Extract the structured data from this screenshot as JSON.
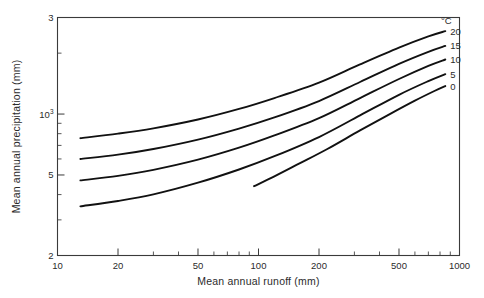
{
  "chart_data": {
    "type": "line",
    "title": "",
    "xlabel": "Mean annual runoff (mm)",
    "ylabel": "Mean annual precipitation (mm)",
    "xscale": "log",
    "yscale": "log",
    "xlim": [
      10,
      1000
    ],
    "ylim": [
      200,
      3000
    ],
    "grid": false,
    "legend_position": "inside-right",
    "legend_title": "°C",
    "xticks": [
      {
        "value": 10,
        "label": "10"
      },
      {
        "value": 20,
        "label": "20"
      },
      {
        "value": 50,
        "label": "50"
      },
      {
        "value": 100,
        "label": "100"
      },
      {
        "value": 200,
        "label": "200"
      },
      {
        "value": 500,
        "label": "500"
      },
      {
        "value": 1000,
        "label": "1000"
      }
    ],
    "xticks_minor": [
      30,
      40,
      60,
      70,
      80,
      90,
      300,
      400,
      600,
      700,
      800,
      900
    ],
    "yticks": [
      {
        "value": 200,
        "label": "2",
        "sup": ""
      },
      {
        "value": 500,
        "label": "5",
        "sup": ""
      },
      {
        "value": 1000,
        "label": "10",
        "sup": "3"
      },
      {
        "value": 3000,
        "label": "3",
        "sup": ""
      }
    ],
    "yticks_minor": [
      300,
      400,
      600,
      700,
      800,
      900,
      2000
    ],
    "series": [
      {
        "name": "20",
        "label": "20",
        "color": "#111111",
        "x": [
          13,
          20,
          30,
          50,
          80,
          120,
          200,
          320,
          500,
          700,
          850
        ],
        "y": [
          760,
          800,
          850,
          940,
          1060,
          1200,
          1430,
          1760,
          2130,
          2420,
          2570
        ]
      },
      {
        "name": "15",
        "label": "15",
        "color": "#111111",
        "x": [
          13,
          20,
          30,
          50,
          80,
          120,
          200,
          320,
          500,
          700,
          850
        ],
        "y": [
          600,
          630,
          672,
          748,
          848,
          963,
          1160,
          1440,
          1770,
          2030,
          2170
        ]
      },
      {
        "name": "10",
        "label": "10",
        "color": "#111111",
        "x": [
          13,
          20,
          30,
          50,
          80,
          120,
          200,
          320,
          500,
          700,
          850
        ],
        "y": [
          470,
          495,
          530,
          595,
          682,
          784,
          955,
          1200,
          1490,
          1730,
          1860
        ]
      },
      {
        "name": "5",
        "label": "5",
        "color": "#111111",
        "x": [
          13,
          20,
          30,
          50,
          80,
          120,
          200,
          320,
          500,
          700,
          850
        ],
        "y": [
          350,
          372,
          401,
          458,
          532,
          619,
          770,
          985,
          1245,
          1455,
          1575
        ]
      },
      {
        "name": "0",
        "label": "0",
        "color": "#111111",
        "x": [
          95,
          120,
          160,
          220,
          320,
          450,
          600,
          750,
          850
        ],
        "y": [
          440,
          492,
          570,
          672,
          830,
          1000,
          1165,
          1300,
          1375
        ]
      }
    ],
    "legend_entries": [
      "20",
      "15",
      "10",
      "5",
      "0"
    ]
  }
}
